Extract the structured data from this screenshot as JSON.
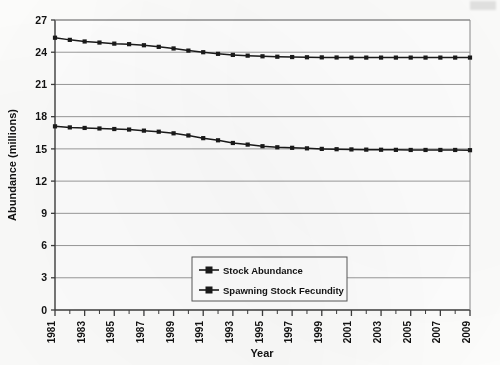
{
  "chart_data": {
    "type": "line",
    "title": "",
    "xlabel": "Year",
    "ylabel": "Abundance (millions)",
    "xlim": [
      1981,
      2009
    ],
    "ylim": [
      0,
      27
    ],
    "yticks": [
      0,
      3,
      6,
      9,
      12,
      15,
      18,
      21,
      24,
      27
    ],
    "ytick_labels": [
      "0",
      "3",
      "6",
      "9",
      "12",
      "15",
      "18",
      "21",
      "24",
      "27"
    ],
    "xticks": [
      1981,
      1983,
      1985,
      1987,
      1989,
      1991,
      1993,
      1995,
      1997,
      1999,
      2001,
      2003,
      2005,
      2007,
      2009
    ],
    "xtick_labels": [
      "1981",
      "1983",
      "1985",
      "1987",
      "1989",
      "1991",
      "1993",
      "1995",
      "1997",
      "1999",
      "2001",
      "2003",
      "2005",
      "2007",
      "2009"
    ],
    "xtick_rotation": 90,
    "grid": "horizontal",
    "legend_position": "lower-center-inside",
    "marker": "square",
    "line_color": "#1a1a1a",
    "marker_color": "#1a1a1a",
    "gridline_color": "#9a9a9a",
    "axis_color": "#4a4a4a",
    "x": [
      1981,
      1982,
      1983,
      1984,
      1985,
      1986,
      1987,
      1988,
      1989,
      1990,
      1991,
      1992,
      1993,
      1994,
      1995,
      1996,
      1997,
      1998,
      1999,
      2000,
      2001,
      2002,
      2003,
      2004,
      2005,
      2006,
      2007,
      2008,
      2009
    ],
    "series": [
      {
        "name": "Stock Abundance",
        "values": [
          25.35,
          25.15,
          25.0,
          24.9,
          24.8,
          24.75,
          24.65,
          24.5,
          24.35,
          24.15,
          24.0,
          23.85,
          23.75,
          23.68,
          23.62,
          23.58,
          23.55,
          23.53,
          23.52,
          23.51,
          23.5,
          23.5,
          23.5,
          23.5,
          23.5,
          23.5,
          23.5,
          23.5,
          23.5
        ]
      },
      {
        "name": "Spawning Stock Fecundity",
        "values": [
          17.1,
          17.0,
          16.95,
          16.9,
          16.85,
          16.8,
          16.7,
          16.6,
          16.45,
          16.25,
          16.0,
          15.8,
          15.55,
          15.4,
          15.25,
          15.15,
          15.1,
          15.05,
          15.0,
          14.97,
          14.95,
          14.93,
          14.92,
          14.91,
          14.9,
          14.9,
          14.9,
          14.9,
          14.88
        ]
      }
    ]
  },
  "legend": {
    "entries": [
      "Stock Abundance",
      "Spawning Stock Fecundity"
    ]
  },
  "axes": {
    "y_title": "Abundance (millions)",
    "x_title": "Year"
  }
}
